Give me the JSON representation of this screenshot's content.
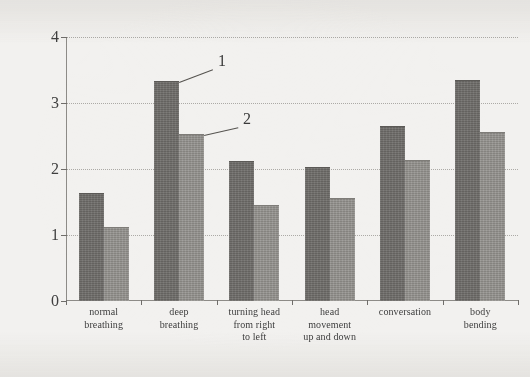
{
  "chart_data": {
    "type": "bar",
    "title": "",
    "xlabel": "",
    "ylabel": "Coefficient, %",
    "ylim": [
      0,
      4
    ],
    "yticks": [
      0,
      1,
      2,
      3,
      4
    ],
    "ytick_labels": [
      "0",
      "1",
      "2",
      "3",
      "4"
    ],
    "grid": true,
    "legend_position": "none",
    "categories": [
      "normal breathing",
      "deep breathing",
      "turning head from right to left",
      "head movement up and down",
      "conversation",
      "body bending"
    ],
    "category_lines": [
      [
        "normal",
        "breathing"
      ],
      [
        "deep",
        "breathing"
      ],
      [
        "turning head",
        "from right",
        "to left"
      ],
      [
        "head",
        "movement",
        "up and down"
      ],
      [
        "conversation"
      ],
      [
        "body",
        "bending"
      ]
    ],
    "series": [
      {
        "name": "1",
        "color": "#6d6b68",
        "values": [
          1.62,
          3.32,
          2.1,
          2.02,
          2.63,
          3.33
        ]
      },
      {
        "name": "2",
        "color": "#918f8b",
        "values": [
          1.11,
          2.52,
          1.44,
          1.54,
          2.12,
          2.54
        ]
      }
    ],
    "annotations": [
      {
        "text": "1",
        "points_to_series": "1",
        "points_to_category": "deep breathing"
      },
      {
        "text": "2",
        "points_to_series": "2",
        "points_to_category": "deep breathing"
      }
    ]
  },
  "figure": {
    "background_color": "#f2f1ef",
    "axis_color": "#8d8b87",
    "gridline_color": "#a9a7a3",
    "text_color": "#3d3d3d"
  }
}
